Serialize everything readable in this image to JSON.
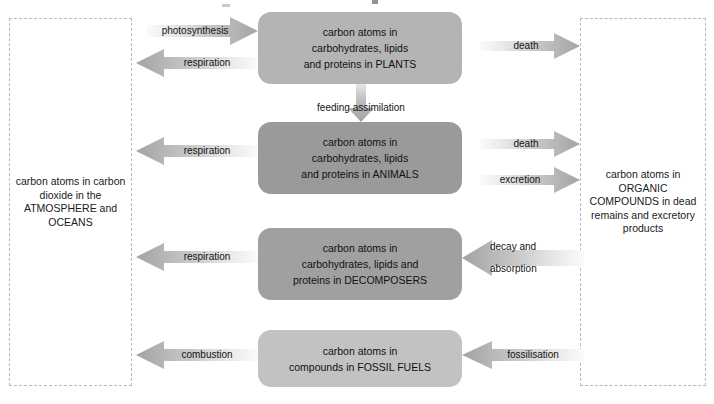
{
  "diagram": {
    "type": "flow-diagram"
  },
  "reservoirs": [
    {
      "id": "atmosphere",
      "label": "carbon atoms in carbon dioxide in the ATMOSPHERE and OCEANS",
      "border_color": "#b9b9b9",
      "style": "dashed"
    },
    {
      "id": "organic",
      "label": "carbon atoms in ORGANIC COMPOUNDS in dead remains and excretory products",
      "border_color": "#b9b9b9",
      "style": "dashed"
    }
  ],
  "pools": [
    {
      "id": "plants",
      "lines": [
        "carbon atoms in",
        "carbohydrates, lipids",
        "and proteins in PLANTS"
      ],
      "color": "#b4b4b4"
    },
    {
      "id": "animals",
      "lines": [
        "carbon atoms in",
        "carbohydrates, lipids",
        "and proteins in ANIMALS"
      ],
      "color": "#9a9a9a"
    },
    {
      "id": "decomposers",
      "lines": [
        "carbon atoms in",
        "carbohydrates, lipids and",
        "proteins in DECOMPOSERS"
      ],
      "color": "#a0a0a0"
    },
    {
      "id": "fossil-fuels",
      "lines": [
        "carbon atoms in",
        "compounds in FOSSIL FUELS"
      ],
      "color": "#c2c2c2"
    }
  ],
  "flows": [
    {
      "id": "photosynthesis",
      "label": "photosynthesis",
      "direction": "right",
      "from": "atmosphere",
      "to": "plants"
    },
    {
      "id": "respiration-plants",
      "label": "respiration",
      "direction": "left",
      "from": "plants",
      "to": "atmosphere"
    },
    {
      "id": "feeding-assimilation",
      "label": "feeding assimilation",
      "direction": "down",
      "from": "plants",
      "to": "animals"
    },
    {
      "id": "death-plants",
      "label": "death",
      "direction": "right",
      "from": "plants",
      "to": "organic"
    },
    {
      "id": "respiration-animals",
      "label": "respiration",
      "direction": "left",
      "from": "animals",
      "to": "atmosphere"
    },
    {
      "id": "death-animals",
      "label": "death",
      "direction": "right",
      "from": "animals",
      "to": "organic"
    },
    {
      "id": "excretion",
      "label": "excretion",
      "direction": "right",
      "from": "animals",
      "to": "organic"
    },
    {
      "id": "respiration-decomposers",
      "label": "respiration",
      "direction": "left",
      "from": "decomposers",
      "to": "atmosphere"
    },
    {
      "id": "decay-absorption",
      "label_line1": "decay and",
      "label_line2": "absorption",
      "direction": "left",
      "from": "organic",
      "to": "decomposers"
    },
    {
      "id": "combustion",
      "label": "combustion",
      "direction": "left",
      "from": "fossil-fuels",
      "to": "atmosphere"
    },
    {
      "id": "fossilisation",
      "label": "fossilisation",
      "direction": "left",
      "from": "organic",
      "to": "fossil-fuels"
    }
  ],
  "colors": {
    "arrow_head": "#a5a5a5",
    "arrow_tail": "#f4f4f4",
    "text": "#141414",
    "background": "#ffffff"
  }
}
